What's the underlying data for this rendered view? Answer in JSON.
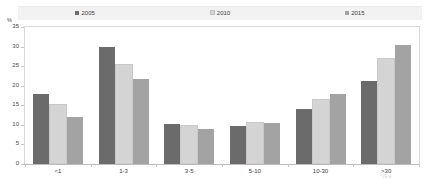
{
  "top_fragment": "",
  "legend": {
    "items": [
      {
        "label": "2005",
        "color": "#6b6b6b"
      },
      {
        "label": "2010",
        "color": "#d4d4d4"
      },
      {
        "label": "2015",
        "color": "#a3a3a3"
      }
    ]
  },
  "axis": {
    "unit": "%",
    "yticks": [
      "35",
      "30",
      "25",
      "20",
      "15",
      "10",
      "5",
      "0"
    ]
  },
  "watermark": "^(9-a",
  "chart_data": {
    "type": "bar",
    "title": "",
    "xlabel": "",
    "ylabel": "%",
    "ylim": [
      0,
      35
    ],
    "ytick_values": [
      0,
      5,
      10,
      15,
      20,
      25,
      30,
      35
    ],
    "grid": false,
    "legend_position": "top",
    "categories": [
      "<1",
      "1-3",
      "3-5",
      "5-10",
      "10-30",
      ">30"
    ],
    "series": [
      {
        "name": "2005",
        "color": "#6b6b6b",
        "values": [
          17.8,
          29.9,
          10.2,
          9.6,
          14.0,
          21.2
        ]
      },
      {
        "name": "2010",
        "color": "#d4d4d4",
        "values": [
          14.7,
          25.1,
          9.5,
          10.2,
          16.2,
          26.7
        ]
      },
      {
        "name": "2015",
        "color": "#a3a3a3",
        "values": [
          11.9,
          21.6,
          9.0,
          10.5,
          18.0,
          30.5
        ]
      }
    ]
  }
}
